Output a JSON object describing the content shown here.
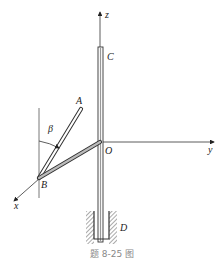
{
  "diagram": {
    "caption": "题 8-25 图",
    "labels": {
      "z_axis": "z",
      "y_axis": "y",
      "x_axis": "x",
      "origin": "O",
      "point_A": "A",
      "point_B": "B",
      "point_C": "C",
      "point_D": "D",
      "angle": "β"
    },
    "colors": {
      "line": "#333333",
      "rod_fill": "#bdbdbd",
      "hatch": "#555555",
      "caption": "#888888"
    }
  }
}
